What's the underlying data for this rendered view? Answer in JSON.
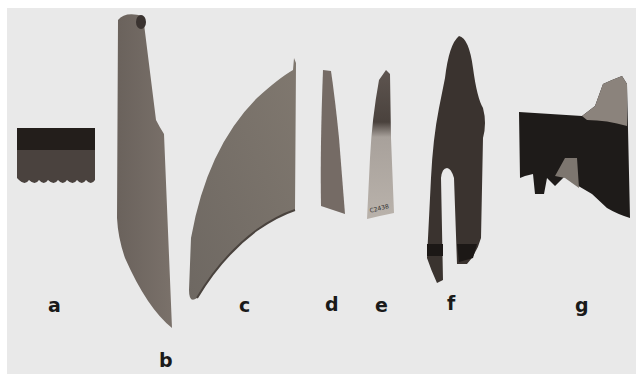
{
  "plate": {
    "background": "#e9e9e9",
    "artifacts": [
      {
        "id": "a",
        "label": "a",
        "description": "rectangular comb-like fragment with scalloped lower edge",
        "color": "#2b2522"
      },
      {
        "id": "b",
        "label": "b",
        "description": "long knife-like blade",
        "color": "#6f6660"
      },
      {
        "id": "c",
        "label": "c",
        "description": "curved crescent blade",
        "color": "#76706b"
      },
      {
        "id": "d",
        "label": "d",
        "description": "narrow tapering fragment",
        "color": "#7a706a"
      },
      {
        "id": "e",
        "label": "e",
        "description": "narrow tapering fragment with catalog number",
        "color": "#a8a09a",
        "catalog_number": "C2438"
      },
      {
        "id": "f",
        "label": "f",
        "description": "forked implement with slot",
        "color": "#3c3430"
      },
      {
        "id": "g",
        "label": "g",
        "description": "dark irregular plank fragment",
        "color": "#1f1c1a"
      }
    ]
  }
}
